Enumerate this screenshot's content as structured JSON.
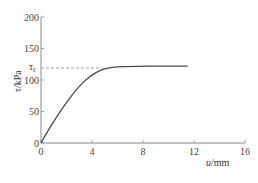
{
  "chart_data": {
    "type": "line",
    "title": "",
    "xlabel": "u/mm",
    "ylabel": "τ/kPa",
    "xlim": [
      0,
      16
    ],
    "ylim": [
      0,
      200
    ],
    "x_ticks": [
      0,
      4,
      8,
      12,
      16
    ],
    "y_ticks": [
      0,
      50,
      100,
      150,
      200
    ],
    "grid": false,
    "legend": null,
    "annotations": [
      {
        "type": "hline-dashed",
        "label": "τf",
        "y": 119,
        "x_range": [
          0,
          4.8
        ]
      }
    ],
    "series": [
      {
        "name": "shear stress–displacement",
        "x": [
          0,
          0.5,
          1,
          1.5,
          2,
          2.5,
          3,
          3.5,
          4,
          4.5,
          5,
          5.5,
          6,
          7,
          8,
          9,
          10,
          11.5
        ],
        "y": [
          0,
          18,
          34,
          50,
          64,
          78,
          90,
          100,
          108,
          114,
          118,
          120,
          121,
          121.5,
          122,
          122,
          122,
          122
        ]
      }
    ]
  },
  "labels": {
    "ylabel_tau": "τ",
    "ylabel_unit": "/kPa",
    "tau_f_main": "τ",
    "tau_f_sub": "f",
    "xlabel_u": "u",
    "xlabel_unit": "/mm"
  },
  "colors": {
    "axis": "#8a8a8a",
    "curve": "#4a4a4a",
    "dashed": "#8a8a8a",
    "text": "#444444"
  }
}
